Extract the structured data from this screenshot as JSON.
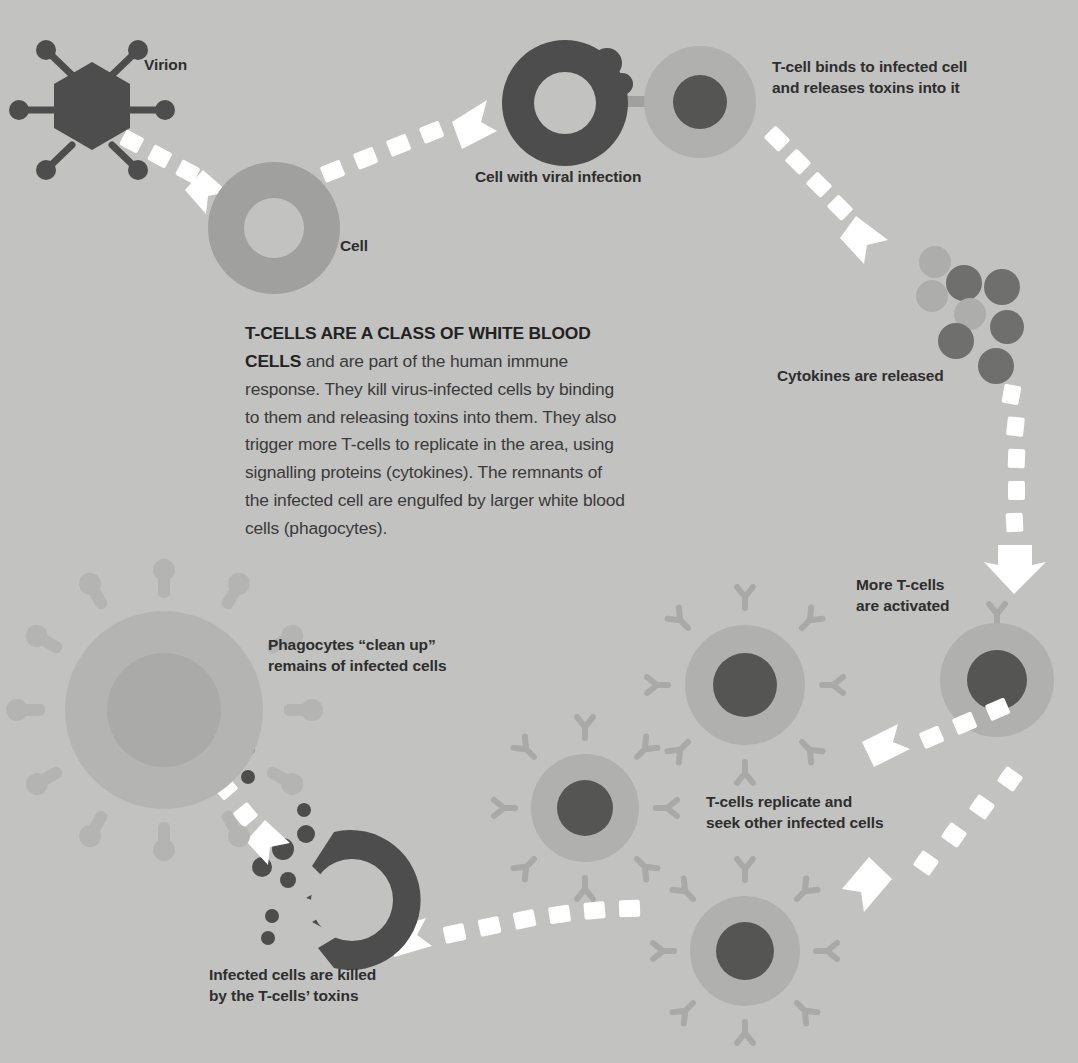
{
  "diagram": {
    "background_color": "#c2c2c0",
    "palette": {
      "background": "#c2c2c0",
      "dark": "#4d4d4d",
      "mid": "#a0a09e",
      "light": "#b0b0ae",
      "arrow": "#ffffff",
      "text": "#2e2e2e",
      "body_text": "#3a3a3a"
    }
  },
  "body": {
    "lead": "T-CELLS ARE A CLASS OF WHITE BLOOD CELLS",
    "rest": " and are part of the human immune response. They kill virus-infected cells by binding to them and releasing toxins into them. They also trigger more T-cells to replicate in the area, using signalling proteins (cytokines). The remnants of the infected cell are engulfed by larger white blood cells (phagocytes)."
  },
  "labels": {
    "virion": "Virion",
    "cell": "Cell",
    "infected_cell": "Cell with viral infection",
    "tcell_binds_line1": "T-cell binds to infected cell",
    "tcell_binds_line2": "and releases toxins into it",
    "cytokines": "Cytokines are released",
    "more_tcells_line1": "More T-cells",
    "more_tcells_line2": "are activated",
    "replicate_line1": "T-cells replicate and",
    "replicate_line2": "seek other infected cells",
    "killed_line1": "Infected cells are killed",
    "killed_line2": "by the T-cells’ toxins",
    "phagocytes_line1": "Phagocytes “clean up”",
    "phagocytes_line2": "remains of infected cells"
  },
  "steps": [
    {
      "id": 1,
      "name": "virion",
      "label": "Virion"
    },
    {
      "id": 2,
      "name": "cell",
      "label": "Cell"
    },
    {
      "id": 3,
      "name": "infected-cell",
      "label": "Cell with viral infection"
    },
    {
      "id": 4,
      "name": "tcell-binding",
      "label": "T-cell binds to infected cell and releases toxins into it"
    },
    {
      "id": 5,
      "name": "cytokines",
      "label": "Cytokines are released"
    },
    {
      "id": 6,
      "name": "more-tcells",
      "label": "More T-cells are activated"
    },
    {
      "id": 7,
      "name": "tcell-replication",
      "label": "T-cells replicate and seek other infected cells"
    },
    {
      "id": 8,
      "name": "infected-cell-killed",
      "label": "Infected cells are killed by the T-cells’ toxins"
    },
    {
      "id": 9,
      "name": "phagocyte-cleanup",
      "label": "Phagocytes “clean up” remains of infected cells"
    }
  ],
  "shape_counts": {
    "virion_spikes": 6,
    "cytokine_particles": 9,
    "phagocyte_pseudopods": 12,
    "activated_tcell_receptors": 8
  }
}
